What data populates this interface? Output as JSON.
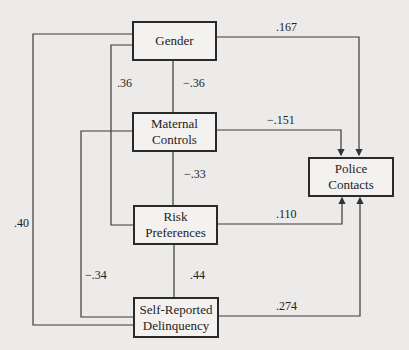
{
  "diagram": {
    "type": "path-model",
    "background": "#ecebe9",
    "line_color": "#333333",
    "nodes": [
      {
        "id": "gender",
        "label": "Gender"
      },
      {
        "id": "maternal",
        "label": "Maternal Controls",
        "line1": "Maternal",
        "line2": "Controls"
      },
      {
        "id": "risk",
        "label": "Risk Preferences",
        "line1": "Risk",
        "line2": "Preferences"
      },
      {
        "id": "selfrep",
        "label": "Self-Reported Delinquency",
        "line1": "Self-Reported",
        "line2": "Delinquency"
      },
      {
        "id": "police",
        "label": "Police Contacts",
        "line1": "Police",
        "line2": "Contacts"
      }
    ],
    "edges": [
      {
        "from": "gender",
        "to": "maternal",
        "coef": "−.36",
        "directed": false
      },
      {
        "from": "gender",
        "to": "risk",
        "coef": ".36",
        "directed": false
      },
      {
        "from": "gender",
        "to": "selfrep",
        "coef": ".40",
        "directed": false
      },
      {
        "from": "maternal",
        "to": "risk",
        "coef": "−.33",
        "directed": false
      },
      {
        "from": "maternal",
        "to": "selfrep",
        "coef": "−.34",
        "directed": false
      },
      {
        "from": "risk",
        "to": "selfrep",
        "coef": ".44",
        "directed": false
      },
      {
        "from": "gender",
        "to": "police",
        "coef": ".167",
        "directed": true
      },
      {
        "from": "maternal",
        "to": "police",
        "coef": "−.151",
        "directed": true
      },
      {
        "from": "risk",
        "to": "police",
        "coef": ".110",
        "directed": true
      },
      {
        "from": "selfrep",
        "to": "police",
        "coef": ".274",
        "directed": true
      }
    ]
  }
}
